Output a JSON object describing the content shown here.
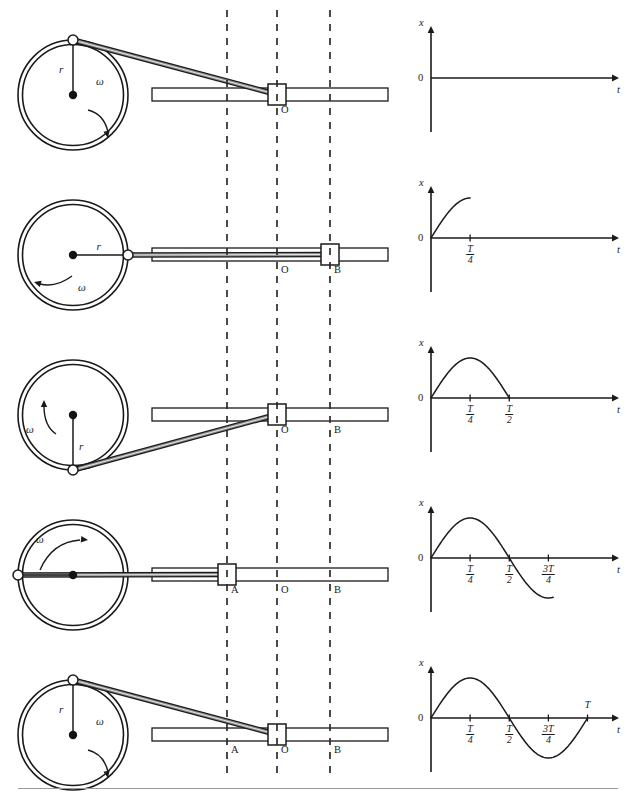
{
  "figure": {
    "circle_label_radius": "r",
    "circle_label_omega": "ω",
    "track_points": {
      "a": "A",
      "o": "O",
      "b": "B"
    }
  },
  "rows": [
    {
      "id": "row-phase-0",
      "phase_label": "0",
      "pin_angle_deg": 90,
      "block_point": "O",
      "show_labels": {
        "a": false,
        "o": true,
        "b": false
      },
      "omega_arrow": "clockwise-right",
      "radius_label": "r",
      "omega_label": "ω"
    },
    {
      "id": "row-phase-quarter",
      "phase_label": "T/4",
      "pin_angle_deg": 0,
      "block_point": "B",
      "show_labels": {
        "a": false,
        "o": true,
        "b": true
      },
      "omega_arrow": "clockwise-left",
      "radius_label": "r",
      "omega_label": "ω"
    },
    {
      "id": "row-phase-half",
      "phase_label": "T/2",
      "pin_angle_deg": 270,
      "block_point": "O",
      "show_labels": {
        "a": false,
        "o": true,
        "b": true
      },
      "omega_arrow": "clockwise-up",
      "radius_label": "r",
      "omega_label": "ω"
    },
    {
      "id": "row-phase-three-quarter",
      "phase_label": "3T/4",
      "pin_angle_deg": 180,
      "block_point": "A",
      "show_labels": {
        "a": true,
        "o": true,
        "b": true
      },
      "omega_arrow": "clockwise-top-right",
      "radius_label": "r",
      "omega_label": "ω"
    },
    {
      "id": "row-phase-full",
      "phase_label": "T",
      "pin_angle_deg": 90,
      "block_point": "O",
      "show_labels": {
        "a": true,
        "o": true,
        "b": true
      },
      "omega_arrow": "clockwise-right",
      "radius_label": "r",
      "omega_label": "ω"
    }
  ],
  "chart_data": [
    {
      "type": "line",
      "title": "",
      "xlabel": "t",
      "ylabel": "x",
      "origin_label": "0",
      "tick_labels": [],
      "grid": false,
      "legend": null,
      "xlim": [
        0,
        1.15
      ],
      "ylim": [
        -1.3,
        1.3
      ],
      "series": [
        {
          "name": "x(t) = r sin(ωt)",
          "t_end": 0.0,
          "x": [],
          "y": []
        }
      ]
    },
    {
      "type": "line",
      "title": "",
      "xlabel": "t",
      "ylabel": "x",
      "origin_label": "0",
      "tick_labels": [
        {
          "text": "T/4",
          "num": "T",
          "den": "4",
          "t": 0.25
        }
      ],
      "grid": false,
      "legend": null,
      "xlim": [
        0,
        1.15
      ],
      "ylim": [
        -1.3,
        1.3
      ],
      "series": [
        {
          "name": "x(t) = r sin(ωt)",
          "t_end": 0.25,
          "x": [
            0,
            0.0625,
            0.125,
            0.1875,
            0.25
          ],
          "y": [
            0,
            0.383,
            0.707,
            0.924,
            1.0
          ]
        }
      ]
    },
    {
      "type": "line",
      "title": "",
      "xlabel": "t",
      "ylabel": "x",
      "origin_label": "0",
      "tick_labels": [
        {
          "text": "T/4",
          "num": "T",
          "den": "4",
          "t": 0.25
        },
        {
          "text": "T/2",
          "num": "T",
          "den": "2",
          "t": 0.5
        }
      ],
      "grid": false,
      "legend": null,
      "xlim": [
        0,
        1.15
      ],
      "ylim": [
        -1.3,
        1.3
      ],
      "series": [
        {
          "name": "x(t) = r sin(ωt)",
          "t_end": 0.5,
          "x": [
            0,
            0.125,
            0.25,
            0.375,
            0.5
          ],
          "y": [
            0,
            0.707,
            1.0,
            0.707,
            0
          ]
        }
      ]
    },
    {
      "type": "line",
      "title": "",
      "xlabel": "t",
      "ylabel": "x",
      "origin_label": "0",
      "tick_labels": [
        {
          "text": "T/4",
          "num": "T",
          "den": "4",
          "t": 0.25
        },
        {
          "text": "T/2",
          "num": "T",
          "den": "2",
          "t": 0.5
        },
        {
          "text": "3T/4",
          "num": "3T",
          "den": "4",
          "t": 0.75
        }
      ],
      "grid": false,
      "legend": null,
      "xlim": [
        0,
        1.15
      ],
      "ylim": [
        -1.3,
        1.3
      ],
      "series": [
        {
          "name": "x(t) = r sin(ωt)",
          "t_end": 0.78,
          "x": [
            0,
            0.25,
            0.5,
            0.75,
            0.78
          ],
          "y": [
            0,
            1.0,
            0,
            -1.0,
            -0.98
          ]
        }
      ]
    },
    {
      "type": "line",
      "title": "",
      "xlabel": "t",
      "ylabel": "x",
      "origin_label": "0",
      "tick_labels": [
        {
          "text": "T/4",
          "num": "T",
          "den": "4",
          "t": 0.25
        },
        {
          "text": "T/2",
          "num": "T",
          "den": "2",
          "t": 0.5
        },
        {
          "text": "3T/4",
          "num": "3T",
          "den": "4",
          "t": 0.75
        },
        {
          "text": "T",
          "num": "T",
          "den": "",
          "t": 1.0
        }
      ],
      "grid": false,
      "legend": null,
      "xlim": [
        0,
        1.15
      ],
      "ylim": [
        -1.3,
        1.3
      ],
      "series": [
        {
          "name": "x(t) = r sin(ωt)",
          "t_end": 1.0,
          "x": [
            0,
            0.25,
            0.5,
            0.75,
            1.0
          ],
          "y": [
            0,
            1.0,
            0,
            -1.0,
            0
          ]
        }
      ]
    }
  ],
  "colors": {
    "ink": "#1a1a1a",
    "rod_fill": "#8a8a8a",
    "dash": "#2b2b2b",
    "rule": "#9a9a9a",
    "pin_fill": "#ffffff",
    "hub_fill": "#111111"
  }
}
